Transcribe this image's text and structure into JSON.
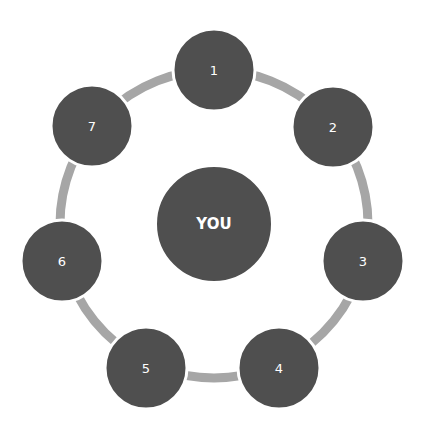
{
  "diagram": {
    "type": "cycle",
    "colors": {
      "node_fill": "#4f4f4f",
      "node_border": "#ffffff",
      "ring": "#a6a6a6",
      "text": "#ffffff",
      "background": "#ffffff"
    },
    "center": {
      "label": "YOU",
      "cx": 214,
      "cy": 224,
      "r": 58
    },
    "ring": {
      "cx": 214,
      "cy": 224,
      "r": 154,
      "width": 9
    },
    "nodes": [
      {
        "label": "1",
        "cx": 214,
        "cy": 70
      },
      {
        "label": "2",
        "cx": 333,
        "cy": 127
      },
      {
        "label": "3",
        "cx": 363,
        "cy": 261
      },
      {
        "label": "4",
        "cx": 279,
        "cy": 368
      },
      {
        "label": "5",
        "cx": 146,
        "cy": 368
      },
      {
        "label": "6",
        "cx": 62,
        "cy": 261
      },
      {
        "label": "7",
        "cx": 92,
        "cy": 126
      }
    ],
    "node_radius": 41
  }
}
